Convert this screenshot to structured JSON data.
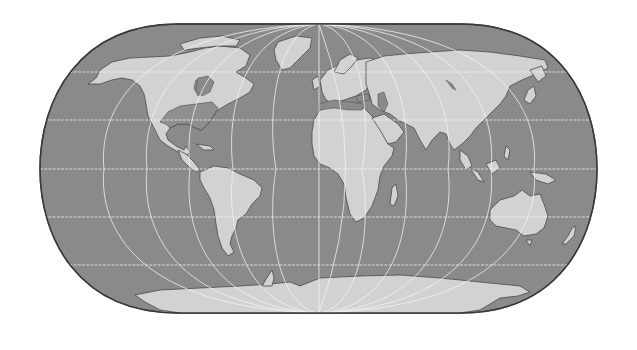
{
  "map": {
    "projection": "pseudocylindrical world map (Eckert IV style)",
    "style": "grayscale",
    "colors": {
      "ocean": "#8a8a8a",
      "land": "#d2d2d2",
      "highlighted_region": "#8f8f8f",
      "graticule": "#f4f4f4",
      "border": "#3a3a3a",
      "background": "#ffffff"
    },
    "graticule": {
      "latitude_lines": 5,
      "meridian_count": 13,
      "meridian_spacing_deg": 30,
      "parallel_spacing_deg": 30
    },
    "features": [
      "North America",
      "Greenland",
      "South America",
      "Europe",
      "Africa",
      "Madagascar",
      "Asia",
      "Japan",
      "Indonesia",
      "Australia",
      "New Zealand",
      "Antarctica"
    ],
    "highlighted_region": "Central/Eastern United States & Hudson Bay area (darker shading)"
  }
}
